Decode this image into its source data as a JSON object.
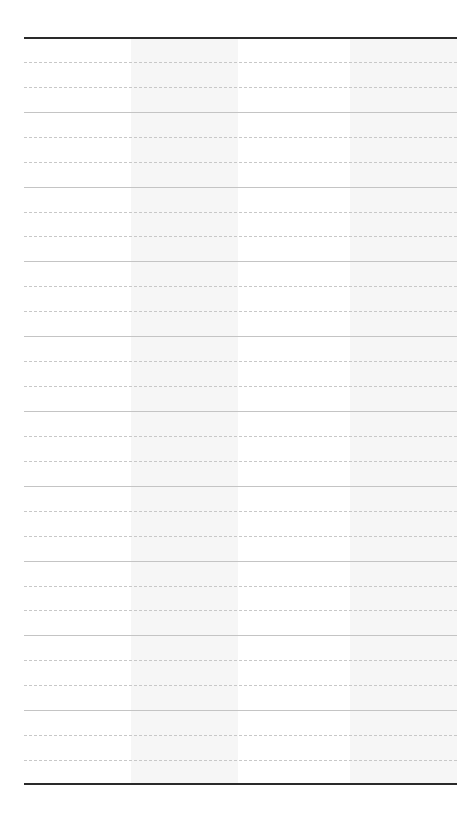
{
  "sheet": {
    "type": "blank ruled table",
    "columns": 4,
    "rows": 30,
    "shaded_columns": [
      1,
      3
    ],
    "row_pattern": [
      "solid",
      "dotted",
      "dotted"
    ],
    "colors": {
      "outer_rule": "#2a2a2a",
      "solid_rule": "#c4c4c4",
      "dotted_rule": "#c8c8c8",
      "column_shade": "#f6f6f6",
      "background": "#ffffff"
    },
    "cells": []
  }
}
